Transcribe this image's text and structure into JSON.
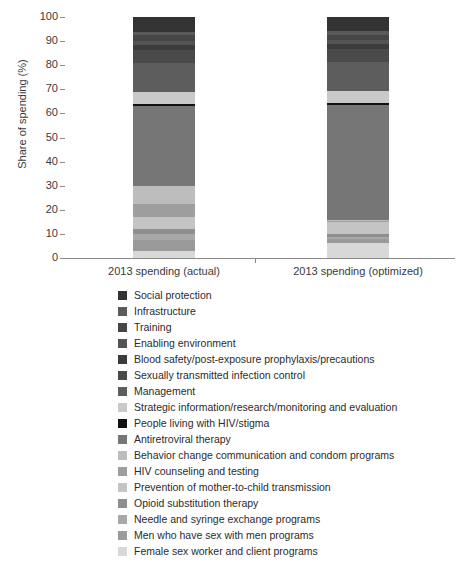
{
  "chart_data": {
    "type": "bar",
    "stacked": true,
    "title": "",
    "xlabel": "",
    "ylabel": "Share of spending (%)",
    "ylim": [
      0,
      100
    ],
    "yticks": [
      0,
      10,
      20,
      30,
      40,
      50,
      60,
      70,
      80,
      90,
      100
    ],
    "grid": false,
    "legend_position": "bottom",
    "categories": [
      "2013 spending (actual)",
      "2013 spending (optimized)"
    ],
    "series": [
      {
        "name": "Female sex worker and client programs",
        "color": "#d8d8d8",
        "values": [
          3.0,
          6.5
        ]
      },
      {
        "name": "Men who have sex with men programs",
        "color": "#9a9a9a",
        "values": [
          4.6,
          1.5
        ]
      },
      {
        "name": "Needle and syringe exchange programs",
        "color": "#a8a8a8",
        "values": [
          2.5,
          1.0
        ]
      },
      {
        "name": "Opioid substitution therapy",
        "color": "#8f8f8f",
        "values": [
          2.0,
          1.0
        ]
      },
      {
        "name": "Prevention of mother-to-child transmission",
        "color": "#c4c4c4",
        "values": [
          5.0,
          5.0
        ]
      },
      {
        "name": "HIV counseling and testing",
        "color": "#9e9e9e",
        "values": [
          5.4,
          0.5
        ]
      },
      {
        "name": "Behavior change communication and condom programs",
        "color": "#bdbdbd",
        "values": [
          7.5,
          0.5
        ]
      },
      {
        "name": "Antiretroviral therapy",
        "color": "#767676",
        "values": [
          33.0,
          48.0
        ]
      },
      {
        "name": "People living with HIV/stigma",
        "color": "#111111",
        "values": [
          0.8,
          0.8
        ]
      },
      {
        "name": "Strategic information/research/monitoring and evaluation",
        "color": "#c9c9c9",
        "values": [
          5.2,
          5.2
        ]
      },
      {
        "name": "Management",
        "color": "#5d5d5d",
        "values": [
          12.0,
          12.0
        ]
      },
      {
        "name": "Sexually transmitted infection control",
        "color": "#4a4a4a",
        "values": [
          5.5,
          5.5
        ]
      },
      {
        "name": "Blood safety/post-exposure prophylaxis/precautions",
        "color": "#3b3b3b",
        "values": [
          2.0,
          2.0
        ]
      },
      {
        "name": "Enabling environment",
        "color": "#545454",
        "values": [
          1.8,
          1.8
        ]
      },
      {
        "name": "Training",
        "color": "#464646",
        "values": [
          2.2,
          2.2
        ]
      },
      {
        "name": "Infrastructure",
        "color": "#5a5a5a",
        "values": [
          1.5,
          1.5
        ]
      },
      {
        "name": "Social protection",
        "color": "#333333",
        "values": [
          6.0,
          6.0
        ]
      }
    ]
  },
  "axis": {
    "y_title": "Share of spending (%)",
    "y_ticks": [
      "100",
      "90",
      "80",
      "70",
      "60",
      "50",
      "40",
      "30",
      "20",
      "10",
      "0"
    ],
    "x_ticks": [
      "2013 spending (actual)",
      "2013 spending (optimized)"
    ]
  },
  "legend": {
    "items": [
      {
        "label": "Social protection",
        "color": "#333333"
      },
      {
        "label": "Infrastructure",
        "color": "#5a5a5a"
      },
      {
        "label": "Training",
        "color": "#464646"
      },
      {
        "label": "Enabling environment",
        "color": "#545454"
      },
      {
        "label": "Blood safety/post-exposure prophylaxis/precautions",
        "color": "#3b3b3b"
      },
      {
        "label": "Sexually transmitted infection control",
        "color": "#4a4a4a"
      },
      {
        "label": "Management",
        "color": "#5d5d5d"
      },
      {
        "label": "Strategic information/research/monitoring and evaluation",
        "color": "#c9c9c9"
      },
      {
        "label": "People living with HIV/stigma",
        "color": "#111111"
      },
      {
        "label": "Antiretroviral therapy",
        "color": "#767676"
      },
      {
        "label": "Behavior change communication and condom programs",
        "color": "#bdbdbd"
      },
      {
        "label": "HIV counseling and testing",
        "color": "#9e9e9e"
      },
      {
        "label": "Prevention of mother-to-child transmission",
        "color": "#c4c4c4"
      },
      {
        "label": "Opioid substitution therapy",
        "color": "#8f8f8f"
      },
      {
        "label": "Needle and syringe exchange programs",
        "color": "#a8a8a8"
      },
      {
        "label": "Men who have sex with men programs",
        "color": "#9a9a9a"
      },
      {
        "label": "Female sex worker and client programs",
        "color": "#d8d8d8"
      }
    ]
  }
}
